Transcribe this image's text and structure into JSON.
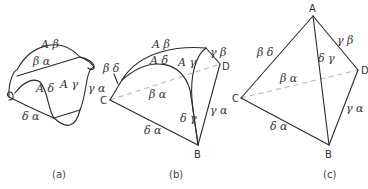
{
  "figure": {
    "panels": [
      {
        "caption": "(a)",
        "labels": {
          "a_beta": "A β",
          "beta_alpha": "β α",
          "a_delta": "A δ",
          "a_gamma": "A γ",
          "gamma_alpha": "γ α",
          "delta_alpha": "δ α"
        }
      },
      {
        "caption": "(b)",
        "vertices": {
          "B": "B",
          "C": "C",
          "D": "D"
        },
        "labels": {
          "a_beta": "A β",
          "a_delta": "A δ",
          "a_gamma": "A γ",
          "gamma_beta": "γ β",
          "beta_delta": "β δ",
          "beta_alpha": "β α",
          "delta_gamma": "δ γ",
          "gamma_alpha": "γ α",
          "delta_alpha": "δ α"
        }
      },
      {
        "caption": "(c)",
        "vertices": {
          "A": "A",
          "B": "B",
          "C": "C",
          "D": "D"
        },
        "labels": {
          "beta_delta": "β δ",
          "gamma_beta": "γ β",
          "delta_gamma": "δ γ",
          "beta_alpha": "β α",
          "gamma_alpha": "γ α",
          "delta_alpha": "δ α"
        }
      }
    ]
  }
}
